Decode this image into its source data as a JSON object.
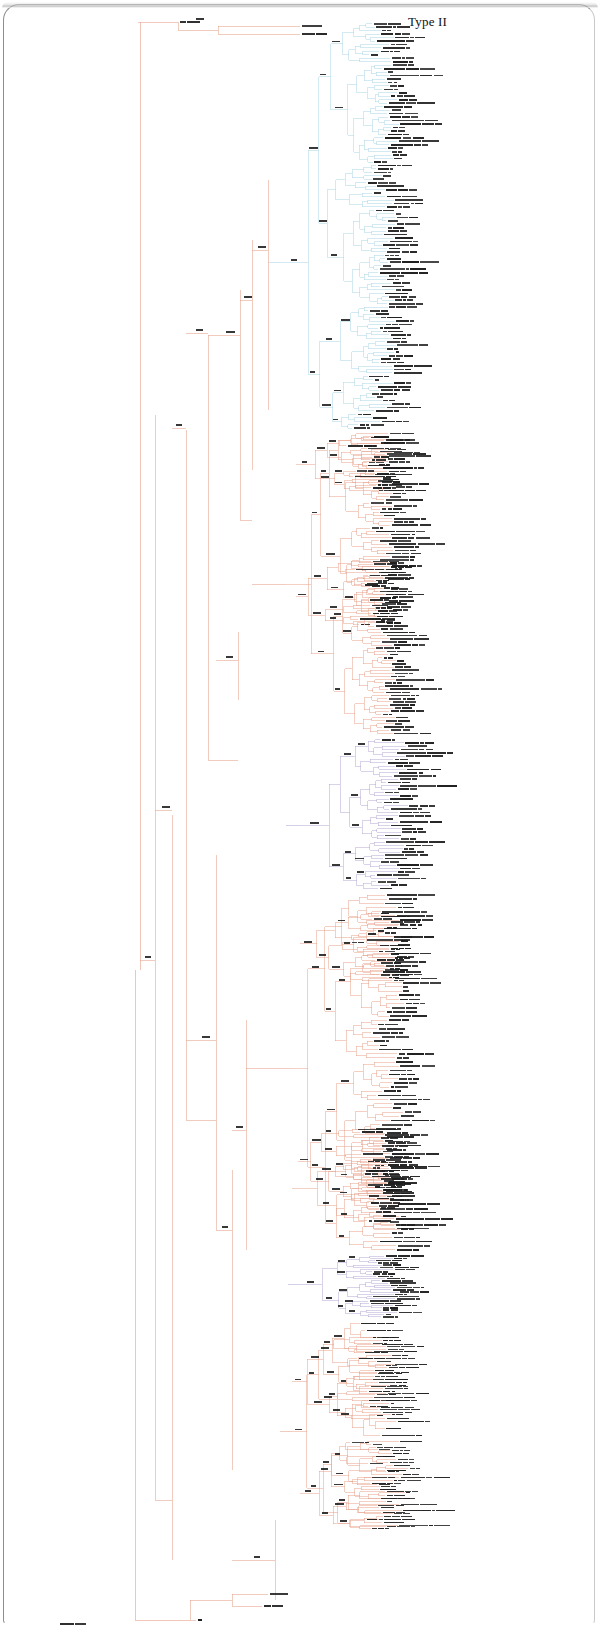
{
  "figure": {
    "panel_label": "Type II",
    "type": "phylogenetic-tree",
    "layout": "rectangular-cladogram",
    "orientation": "left-to-right",
    "background": "#ffffff",
    "frame_color": "#8e8e8e"
  },
  "palette": {
    "backbone": "#e8a08a",
    "salmon": "#e8a08a",
    "cyan": "#a9d6e5",
    "purple": "#b3a6d4",
    "label": "#1a1a1a",
    "root": "#e8a08a"
  },
  "chart_data": {
    "type": "tree",
    "title": "Type II",
    "tip_count": 402,
    "clades": [
      {
        "name": "outgroup-top",
        "color": "#e8a08a",
        "tip_range": [
          0,
          2
        ],
        "y_range": [
          18,
          35
        ]
      },
      {
        "name": "cyan-clade",
        "color": "#a9d6e5",
        "tip_range": [
          3,
          118
        ],
        "y_range": [
          22,
          430
        ]
      },
      {
        "name": "salmon-clade-upper",
        "color": "#e8a08a",
        "tip_range": [
          119,
          210
        ],
        "y_range": [
          432,
          735
        ]
      },
      {
        "name": "purple-clade-1",
        "color": "#b3a6d4",
        "tip_range": [
          211,
          256
        ],
        "y_range": [
          738,
          890
        ]
      },
      {
        "name": "salmon-clade-mid",
        "color": "#e8a08a",
        "tip_range": [
          257,
          340
        ],
        "y_range": [
          893,
          1252
        ]
      },
      {
        "name": "purple-clade-2",
        "color": "#b3a6d4",
        "tip_range": [
          341,
          368
        ],
        "y_range": [
          1255,
          1318
        ]
      },
      {
        "name": "salmon-clade-lower",
        "color": "#e8a08a",
        "tip_range": [
          369,
          396
        ],
        "y_range": [
          1320,
          1530
        ]
      },
      {
        "name": "root-basal",
        "color": "#e8a08a",
        "tip_range": [
          397,
          401
        ],
        "y_range": [
          1575,
          1625
        ]
      }
    ],
    "axis": {
      "x_units": "substitutions-per-site",
      "ticks_shown": false,
      "grid": false
    },
    "legend": {
      "shown": false
    },
    "annotations": [
      {
        "text": "Type II",
        "x": 408,
        "y": 22,
        "role": "panel-label"
      }
    ]
  },
  "tree": {
    "root": {
      "x": 135,
      "y": 1620
    },
    "note": "branch geometry generated procedurally from clade spec",
    "backbone_nodes": [
      {
        "id": "n-root",
        "x": 135,
        "y": 1620,
        "support": ""
      },
      {
        "id": "n-b1",
        "x": 140,
        "y": 960,
        "support": ""
      },
      {
        "id": "n-b2",
        "x": 155,
        "y": 415,
        "support": "100/100"
      },
      {
        "id": "n-b3",
        "x": 172,
        "y": 815,
        "support": "91"
      },
      {
        "id": "n-b4",
        "x": 186,
        "y": 430,
        "support": "100/100"
      },
      {
        "id": "n-b5",
        "x": 208,
        "y": 335,
        "support": "100/99"
      },
      {
        "id": "n-b6",
        "x": 216,
        "y": 855,
        "support": "100/100"
      },
      {
        "id": "n-b7",
        "x": 232,
        "y": 1170,
        "support": "100/100"
      },
      {
        "id": "n-b8",
        "x": 240,
        "y": 290,
        "support": "96/87"
      },
      {
        "id": "n-b9",
        "x": 252,
        "y": 240,
        "support": "98/94"
      },
      {
        "id": "n-b10",
        "x": 268,
        "y": 180,
        "support": "100"
      },
      {
        "id": "n-b11",
        "x": 238,
        "y": 632,
        "support": "100"
      },
      {
        "id": "n-b12",
        "x": 246,
        "y": 1020,
        "support": "100/99"
      },
      {
        "id": "n-b13",
        "x": 275,
        "y": 1600,
        "support": ""
      }
    ]
  },
  "tip_labels": {
    "style": "prefix_underscore_binomial",
    "sample": [
      "MHCIIa_Homo_sapiens",
      "MHCIIb_Pan_troglodytes",
      "MHCIIa_Mus_musculus",
      "MHCIIb_Rattus_norvegicus",
      "MHCIIa_Bos_taurus",
      "MHCIIb_Sus_scrofa",
      "MHCIIa_Canis_lupus",
      "MHCIIb_Felis_catus",
      "MHCIIa_Equus_caballus",
      "MHCIIb_Ovis_aries",
      "MHCIIa_Gallus_gallus",
      "MHCIIb_Danio_rerio",
      "MHCIIa_Xenopus_laevis",
      "MHCIIb_Oryctolagus_cuniculus",
      "MHCIIa_Macaca_mulatta",
      "MHCIIb_Monodelphis_domestica",
      "MHCIIa_Salmo_salar",
      "MHCIIb_Oncorhynchus_mykiss",
      "MHCIIa_Takifugu_rubripes",
      "MHCIIb_Gadus_morhua"
    ],
    "visible_text_legibility": "sub-pixel; rendered as micro-text"
  }
}
